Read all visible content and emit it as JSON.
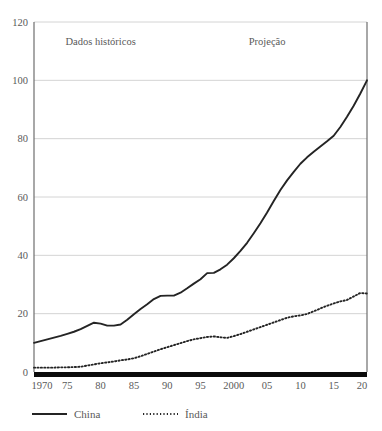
{
  "chart_data": {
    "type": "line",
    "title": "",
    "subtitle": "",
    "xlabel": "",
    "ylabel": "",
    "xlim": [
      1970,
      2020
    ],
    "ylim": [
      0,
      120
    ],
    "grid": true,
    "legend_position": "bottom-left",
    "y_ticks": [
      0,
      20,
      40,
      60,
      80,
      100,
      120
    ],
    "y_tick_labels": [
      "0",
      "20",
      "40",
      "60",
      "80",
      "100",
      "120"
    ],
    "x_ticks": [
      1970,
      1975,
      1980,
      1985,
      1990,
      1995,
      2000,
      2005,
      2010,
      2015,
      2020
    ],
    "x_tick_labels": [
      "1970",
      "75",
      "80",
      "85",
      "90",
      "95",
      "2000",
      "05",
      "10",
      "15",
      "20"
    ],
    "annotations": [
      {
        "text": "Dados históricos",
        "x": 1980,
        "y": 112
      },
      {
        "text": "Projeção",
        "x": 2005,
        "y": 112
      }
    ],
    "series": [
      {
        "name": "China",
        "style": "solid",
        "color": "#242424",
        "x": [
          1970,
          1971,
          1972,
          1973,
          1974,
          1975,
          1976,
          1977,
          1978,
          1979,
          1980,
          1981,
          1982,
          1983,
          1984,
          1985,
          1986,
          1987,
          1988,
          1989,
          1990,
          1991,
          1992,
          1993,
          1994,
          1995,
          1996,
          1997,
          1998,
          1999,
          2000,
          2001,
          2002,
          2003,
          2004,
          2005,
          2006,
          2007,
          2008,
          2009,
          2010,
          2011,
          2012,
          2013,
          2014,
          2015,
          2016,
          2017,
          2018,
          2019,
          2020
        ],
        "values": [
          10.0,
          10.6,
          11.2,
          11.8,
          12.4,
          13.1,
          13.8,
          14.7,
          15.8,
          16.9,
          16.6,
          15.9,
          15.9,
          16.3,
          17.9,
          19.8,
          21.6,
          23.2,
          25.0,
          26.1,
          26.2,
          26.2,
          27.2,
          28.7,
          30.3,
          31.8,
          33.9,
          34.0,
          35.2,
          36.8,
          39.0,
          41.5,
          44.3,
          47.6,
          51.0,
          54.7,
          58.6,
          62.4,
          65.7,
          68.6,
          71.4,
          73.6,
          75.5,
          77.3,
          79.1,
          81.0,
          84.0,
          87.5,
          91.3,
          95.5,
          100.0
        ]
      },
      {
        "name": "Índia",
        "style": "dotted",
        "color": "#242424",
        "x": [
          1970,
          1971,
          1972,
          1973,
          1974,
          1975,
          1976,
          1977,
          1978,
          1979,
          1980,
          1981,
          1982,
          1983,
          1984,
          1985,
          1986,
          1987,
          1988,
          1989,
          1990,
          1991,
          1992,
          1993,
          1994,
          1995,
          1996,
          1997,
          1998,
          1999,
          2000,
          2001,
          2002,
          2003,
          2004,
          2005,
          2006,
          2007,
          2008,
          2009,
          2010,
          2011,
          2012,
          2013,
          2014,
          2015,
          2016,
          2017,
          2018,
          2019,
          2020
        ],
        "values": [
          1.5,
          1.5,
          1.5,
          1.5,
          1.6,
          1.6,
          1.7,
          1.8,
          2.2,
          2.6,
          3.0,
          3.3,
          3.6,
          4.0,
          4.3,
          4.7,
          5.4,
          6.2,
          7.0,
          7.8,
          8.5,
          9.2,
          9.9,
          10.6,
          11.2,
          11.6,
          12.0,
          12.2,
          11.9,
          11.7,
          12.3,
          13.0,
          13.8,
          14.6,
          15.4,
          16.2,
          17.0,
          17.8,
          18.6,
          19.1,
          19.4,
          19.9,
          20.8,
          21.8,
          22.7,
          23.5,
          24.2,
          24.7,
          25.9,
          27.1,
          26.9
        ]
      }
    ]
  },
  "legend": {
    "items": [
      {
        "label": "China",
        "style": "solid"
      },
      {
        "label": "Índia",
        "style": "dotted"
      }
    ]
  }
}
